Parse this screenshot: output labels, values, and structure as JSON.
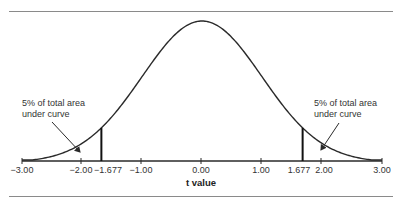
{
  "chart_data": {
    "type": "line",
    "title": "",
    "xlabel": "t value",
    "ylabel": "",
    "xlim": [
      -3.0,
      3.0
    ],
    "x_ticks": [
      "-3.00",
      "-2.00",
      "-1.677",
      "-1.00",
      "0.00",
      "1.00",
      "1.677",
      "2.00",
      "3.00"
    ],
    "critical_values": [
      -1.677,
      1.677
    ],
    "annotations": [
      {
        "side": "left",
        "line1": "5% of total area",
        "line2": "under curve"
      },
      {
        "side": "right",
        "line1": "5% of total area",
        "line2": "under curve"
      }
    ],
    "grid": false,
    "legend": null
  },
  "ticks": [
    {
      "label": "−3.00",
      "x": 22
    },
    {
      "label": "−2.00",
      "x": 81
    },
    {
      "label": "−1.677",
      "x": 108
    },
    {
      "label": "−1.00",
      "x": 141
    },
    {
      "label": "0.00",
      "x": 201
    },
    {
      "label": "1.00",
      "x": 261
    },
    {
      "label": "1.677",
      "x": 299
    },
    {
      "label": "2.00",
      "x": 324
    },
    {
      "label": "3.00",
      "x": 382
    }
  ],
  "xlabel": "t value",
  "left_annot": {
    "line1": "5% of total area",
    "line2": "under curve"
  },
  "right_annot": {
    "line1": "5% of total area",
    "line2": "under curve"
  }
}
